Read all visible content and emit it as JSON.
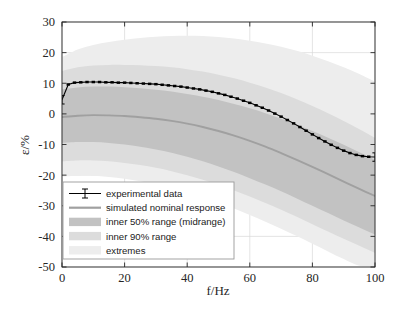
{
  "chart_data": {
    "type": "line",
    "title": "",
    "xlabel": "f/Hz",
    "ylabel": "ε/%",
    "xlim": [
      0,
      100
    ],
    "ylim": [
      -50,
      30
    ],
    "xticks": [
      0,
      20,
      40,
      60,
      80,
      100
    ],
    "yticks": [
      30,
      20,
      10,
      0,
      -10,
      -20,
      -30,
      -40,
      -50
    ],
    "xtick_labels": [
      "0",
      "20",
      "40",
      "60",
      "80",
      "100"
    ],
    "ytick_labels": [
      "30",
      "20",
      "10",
      "0",
      "-10",
      "-20",
      "-30",
      "-40",
      "-50"
    ],
    "grid": true,
    "legend_position": "lower-left",
    "series": [
      {
        "name": "experimental data",
        "kind": "errorbar-line",
        "color": "#000000",
        "x": [
          0,
          2,
          4,
          6,
          8,
          10,
          12,
          14,
          16,
          18,
          20,
          22,
          24,
          26,
          28,
          30,
          32,
          34,
          36,
          38,
          40,
          42,
          44,
          46,
          48,
          50,
          52,
          54,
          56,
          58,
          60,
          62,
          64,
          66,
          68,
          70,
          72,
          74,
          76,
          78,
          80,
          82,
          84,
          86,
          88,
          90,
          92,
          94,
          96,
          98,
          100
        ],
        "values": [
          4.6,
          9.6,
          10.2,
          10.3,
          10.4,
          10.4,
          10.4,
          10.3,
          10.3,
          10.2,
          10.2,
          10.1,
          10.0,
          9.9,
          9.8,
          9.7,
          9.5,
          9.3,
          9.1,
          8.9,
          8.6,
          8.3,
          8.0,
          7.6,
          7.2,
          6.7,
          6.2,
          5.6,
          5.0,
          4.3,
          3.6,
          2.8,
          2.0,
          1.1,
          0.1,
          -0.9,
          -2.0,
          -3.1,
          -4.3,
          -5.5,
          -6.7,
          -7.9,
          -9.0,
          -10.1,
          -11.1,
          -12.0,
          -12.8,
          -13.4,
          -13.8,
          -14.0,
          -14.1
        ]
      },
      {
        "name": "simulated nominal response",
        "kind": "line",
        "color": "#a0a0a0",
        "x": [
          0,
          5,
          10,
          15,
          20,
          25,
          30,
          35,
          40,
          45,
          50,
          55,
          60,
          65,
          70,
          75,
          80,
          85,
          90,
          95,
          100
        ],
        "values": [
          -1.0,
          -0.6,
          -0.4,
          -0.5,
          -0.7,
          -1.1,
          -1.6,
          -2.3,
          -3.2,
          -4.3,
          -5.6,
          -7.1,
          -8.8,
          -10.7,
          -12.8,
          -15.0,
          -17.3,
          -19.7,
          -22.1,
          -24.5,
          -26.8
        ]
      }
    ],
    "bands": [
      {
        "name": "extremes",
        "opacity_color": "#ededed",
        "x": [
          0,
          5,
          10,
          15,
          20,
          25,
          30,
          35,
          40,
          45,
          50,
          55,
          60,
          65,
          70,
          75,
          80,
          85,
          90,
          95,
          100
        ],
        "upper": [
          18.5,
          21.0,
          22.5,
          23.5,
          24.2,
          24.8,
          25.2,
          25.4,
          25.5,
          25.4,
          25.1,
          24.6,
          23.9,
          23.0,
          21.9,
          20.6,
          19.0,
          17.2,
          15.2,
          13.0,
          10.5
        ],
        "lower": [
          -20.5,
          -20.2,
          -20.2,
          -20.6,
          -21.2,
          -22.0,
          -23.0,
          -24.2,
          -25.6,
          -27.2,
          -29.0,
          -30.9,
          -33.0,
          -35.2,
          -37.5,
          -39.9,
          -42.4,
          -44.9,
          -47.4,
          -49.6,
          -50.0
        ]
      },
      {
        "name": "inner 90% range",
        "opacity_color": "#dcdcdc",
        "x": [
          0,
          5,
          10,
          15,
          20,
          25,
          30,
          35,
          40,
          45,
          50,
          55,
          60,
          65,
          70,
          75,
          80,
          85,
          90,
          95,
          100
        ],
        "upper": [
          14.0,
          15.2,
          15.8,
          16.0,
          16.0,
          15.9,
          15.6,
          15.2,
          14.6,
          13.8,
          12.8,
          11.6,
          10.2,
          8.6,
          6.8,
          4.8,
          2.6,
          0.2,
          -2.3,
          -5.0,
          -7.8
        ],
        "lower": [
          -15.5,
          -15.2,
          -15.2,
          -15.5,
          -16.0,
          -16.7,
          -17.6,
          -18.7,
          -20.0,
          -21.5,
          -23.2,
          -25.0,
          -27.0,
          -29.1,
          -31.3,
          -33.6,
          -36.0,
          -38.4,
          -40.8,
          -43.1,
          -45.4
        ]
      },
      {
        "name": "inner 50% range (midrange)",
        "opacity_color": "#c2c2c2",
        "x": [
          0,
          5,
          10,
          15,
          20,
          25,
          30,
          35,
          40,
          45,
          50,
          55,
          60,
          65,
          70,
          75,
          80,
          85,
          90,
          95,
          100
        ],
        "upper": [
          8.0,
          8.6,
          8.9,
          8.9,
          8.7,
          8.4,
          7.9,
          7.3,
          6.5,
          5.6,
          4.5,
          3.2,
          1.8,
          0.2,
          -1.6,
          -3.5,
          -5.6,
          -7.8,
          -10.1,
          -12.5,
          -15.0
        ],
        "lower": [
          -9.5,
          -9.2,
          -9.2,
          -9.5,
          -10.0,
          -10.7,
          -11.6,
          -12.7,
          -14.0,
          -15.5,
          -17.2,
          -19.0,
          -21.0,
          -23.1,
          -25.3,
          -27.6,
          -30.0,
          -32.4,
          -34.8,
          -37.1,
          -39.4
        ]
      }
    ],
    "legend_entries": [
      {
        "label": "experimental data",
        "marker": "errorbar"
      },
      {
        "label": "simulated nominal response",
        "marker": "line"
      },
      {
        "label": "inner 50% range (midrange)",
        "marker": "patch-dark"
      },
      {
        "label": "inner 90% range",
        "marker": "patch-mid"
      },
      {
        "label": "extremes",
        "marker": "patch-light"
      }
    ]
  },
  "colors": {
    "axis": "#262626",
    "grid": "#d9d9d9",
    "data_line": "#000000",
    "nominal_line": "#a0a0a0",
    "band_inner50": "#c2c2c2",
    "band_inner90": "#dcdcdc",
    "band_extremes": "#ededed",
    "background": "#ffffff",
    "legend_border": "#9a9a9a"
  }
}
